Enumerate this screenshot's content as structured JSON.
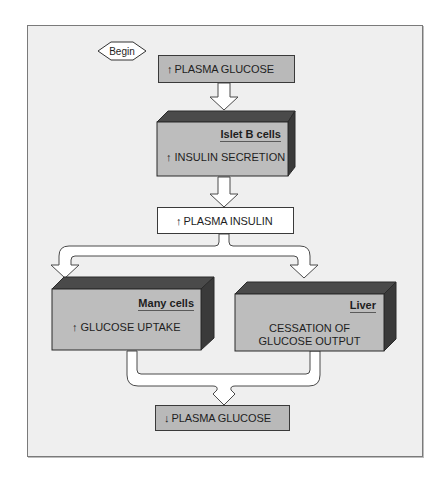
{
  "diagram": {
    "start_label": "Begin",
    "steps": [
      {
        "id": "plasma-glucose-up",
        "arrow": "↑",
        "label": "PLASMA GLUCOSE"
      },
      {
        "id": "islet-b-cells",
        "tissue": "Islet B cells",
        "arrow": "↑",
        "label": "INSULIN SECRETION"
      },
      {
        "id": "plasma-insulin-up",
        "arrow": "↑",
        "label": "PLASMA INSULIN"
      },
      {
        "id": "many-cells",
        "tissue": "Many cells",
        "arrow": "↑",
        "label": "GLUCOSE UPTAKE"
      },
      {
        "id": "liver",
        "tissue": "Liver",
        "label_line1": "CESSATION OF",
        "label_line2": "GLUCOSE OUTPUT"
      },
      {
        "id": "plasma-glucose-down",
        "arrow": "↓",
        "label": "PLASMA GLUCOSE"
      }
    ],
    "colors": {
      "frame_bg": "#efefef",
      "box_gray": "#b9b9b9",
      "box_face": "#bdbdbd",
      "box_top": "#4a4a4a",
      "box_side": "#3a3a3a",
      "box_white": "#ffffff"
    }
  }
}
